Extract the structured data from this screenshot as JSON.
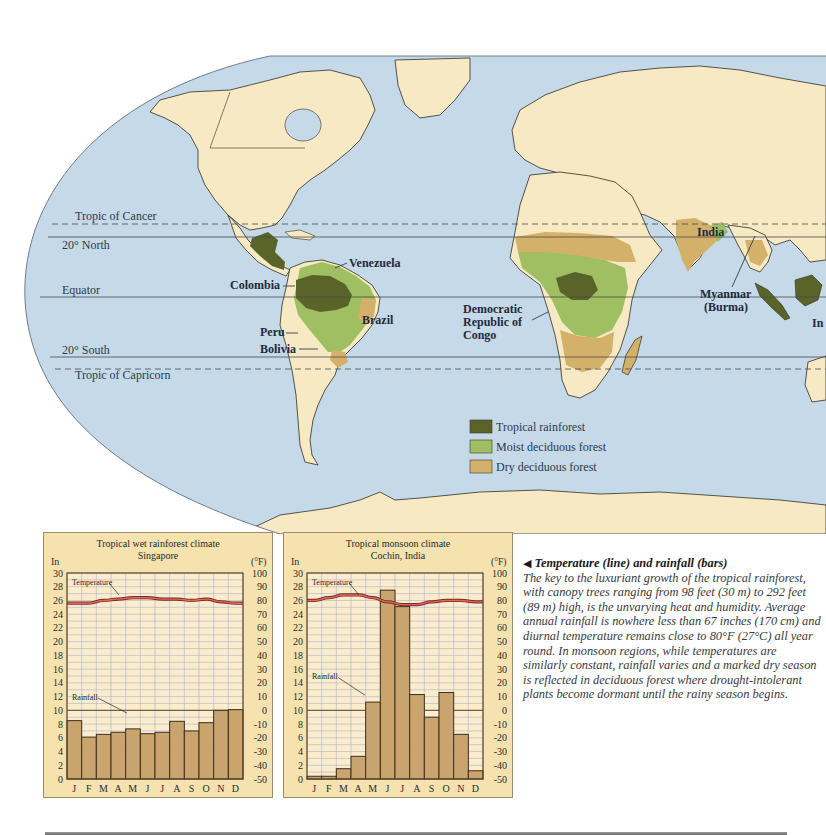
{
  "map": {
    "latitude_lines": [
      {
        "label": "Tropic of Cancer",
        "style": "dashed"
      },
      {
        "label": "20° North",
        "style": "solid"
      },
      {
        "label": "Equator",
        "style": "solid"
      },
      {
        "label": "20° South",
        "style": "solid"
      },
      {
        "label": "Tropic of Capricorn",
        "style": "dashed"
      }
    ],
    "country_labels": {
      "venezuela": "Venezuela",
      "colombia": "Colombia",
      "brazil": "Brazil",
      "peru": "Peru",
      "bolivia": "Bolivia",
      "drc": [
        "Democratic",
        "Republic of",
        "Congo"
      ],
      "india": "India",
      "myanmar": [
        "Myanmar",
        "(Burma)"
      ],
      "indonesia_partial": "In"
    },
    "legend": [
      {
        "label": "Tropical rainforest",
        "color": "#5b6428"
      },
      {
        "label": "Moist deciduous forest",
        "color": "#9fbf62"
      },
      {
        "label": "Dry deciduous forest",
        "color": "#d4b16b"
      }
    ],
    "colors": {
      "ocean": "#c5d9e8",
      "land": "#f7e9c3",
      "rainforest": "#5b6428",
      "moist": "#9fbf62",
      "dry": "#d4b16b",
      "border": "#2e2e24"
    }
  },
  "caption": {
    "title": "Temperature (line) and rainfall (bars)",
    "body": "The key to the luxuriant growth of the tropical rainforest, with canopy trees ranging from 98 feet (30 m) to 292 feet (89 m) high, is the unvarying heat and humidity. Average annual rainfall is nowhere less than 67 inches (170 cm) and diurnal temperature remains close to 80°F (27°C) all year round. In monsoon regions, while temperatures are similarly constant, rainfall varies and a marked dry season is reflected in deciduous forest where drought-intolerant plants become dormant until the rainy season begins."
  },
  "chart_data": [
    {
      "type": "bar",
      "title": "Tropical wet rainforest climate",
      "subtitle": "Singapore",
      "xlabel": "",
      "ylabel": "In",
      "ylabel_right": "(°F)",
      "ylim": [
        0,
        30
      ],
      "ylim_right": [
        -50,
        100
      ],
      "yticks": [
        0,
        2,
        4,
        6,
        8,
        10,
        12,
        14,
        16,
        18,
        20,
        22,
        24,
        26,
        28,
        30
      ],
      "yticks_right": [
        -50,
        -40,
        -30,
        -20,
        -10,
        0,
        10,
        20,
        30,
        40,
        50,
        60,
        70,
        80,
        90,
        100
      ],
      "categories": [
        "J",
        "F",
        "M",
        "A",
        "M",
        "J",
        "J",
        "A",
        "S",
        "O",
        "N",
        "D"
      ],
      "grid": true,
      "annotations": [
        "Temperature",
        "Rainfall"
      ],
      "series": [
        {
          "name": "Rainfall",
          "type": "bar",
          "axis": "left",
          "unit": "in",
          "values": [
            8.5,
            6.1,
            6.5,
            6.8,
            7.3,
            6.6,
            6.8,
            8.4,
            7.0,
            8.2,
            10.0,
            10.1
          ]
        },
        {
          "name": "Temperature",
          "type": "line",
          "axis": "right",
          "unit": "°F",
          "values": [
            78,
            78,
            80,
            81,
            82,
            82,
            81,
            81,
            80,
            81,
            79,
            78
          ]
        }
      ]
    },
    {
      "type": "bar",
      "title": "Tropical monsoon climate",
      "subtitle": "Cochin, India",
      "xlabel": "",
      "ylabel": "In",
      "ylabel_right": "(°F)",
      "ylim": [
        0,
        30
      ],
      "ylim_right": [
        -50,
        100
      ],
      "yticks": [
        0,
        2,
        4,
        6,
        8,
        10,
        12,
        14,
        16,
        18,
        20,
        22,
        24,
        26,
        28,
        30
      ],
      "yticks_right": [
        -50,
        -40,
        -30,
        -20,
        -10,
        0,
        10,
        20,
        30,
        40,
        50,
        60,
        70,
        80,
        90,
        100
      ],
      "categories": [
        "J",
        "F",
        "M",
        "A",
        "M",
        "J",
        "J",
        "A",
        "S",
        "O",
        "N",
        "D"
      ],
      "grid": true,
      "annotations": [
        "Temperature",
        "Rainfall"
      ],
      "series": [
        {
          "name": "Rainfall",
          "type": "bar",
          "axis": "left",
          "unit": "in",
          "values": [
            0.4,
            0.4,
            1.5,
            3.3,
            11.2,
            27.5,
            25.1,
            12.3,
            9.0,
            12.6,
            6.5,
            1.2
          ]
        },
        {
          "name": "Temperature",
          "type": "line",
          "axis": "right",
          "unit": "°F",
          "values": [
            80,
            82,
            84,
            84,
            82,
            79,
            77,
            77,
            79,
            80,
            80,
            79
          ]
        }
      ]
    }
  ]
}
